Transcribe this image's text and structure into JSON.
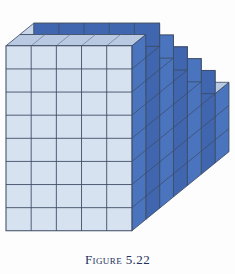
{
  "figure": {
    "caption_label": "Figure",
    "caption_number": "5.22",
    "caption_full": "FIGURE 5.22",
    "alt": "Isometric drawing of a solid staircase built from unit cubes"
  },
  "colors": {
    "background": "#fdfdfd",
    "front_face": "#d6e2f0",
    "front_face_alt": "#cddbec",
    "side_face": "#4a74bd",
    "side_face_dark": "#3f66ae",
    "top_face": "#b9c9e2",
    "top_face_light": "#c9d6ea",
    "edge_stroke": "#3c4a63",
    "edge_stroke_light": "#6d7c99",
    "caption_text": "#23325e"
  },
  "geometry": {
    "projection": "isometric-oblique",
    "unit_cube_width": 24.5,
    "unit_cube_height": 22.5,
    "depth_dx": 13.5,
    "depth_dy": -11.0,
    "front_columns": 5,
    "front_rows": 8,
    "depth_units": 7,
    "step_count": 5,
    "step_rise_units": 1,
    "step_run_units": 1,
    "description": "Solid staircase: height decreases by one cube for every step moving back-right in depth"
  },
  "chart_data": {
    "type": "bar",
    "categories": [
      "1",
      "2",
      "3",
      "4",
      "5",
      "6",
      "7"
    ],
    "values": [
      8,
      8,
      7,
      6,
      5,
      4,
      4
    ],
    "xlabel": "Depth layer (front to back)",
    "ylabel": "Cubes tall",
    "ylim": [
      0,
      8
    ]
  }
}
